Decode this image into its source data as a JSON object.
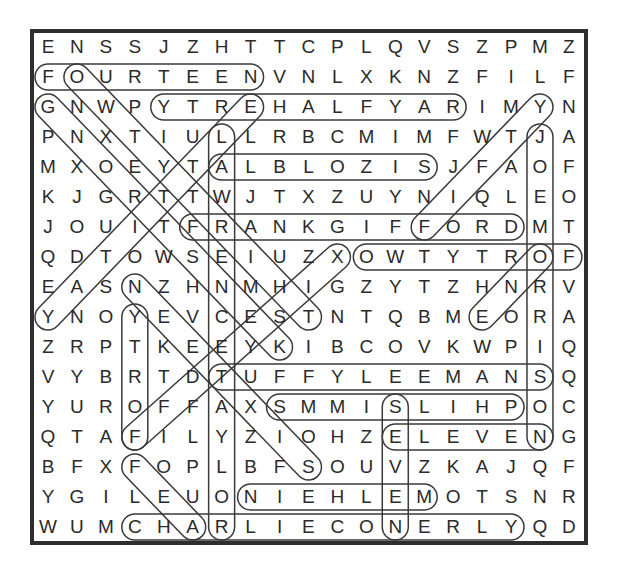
{
  "puzzle": {
    "type": "word-search",
    "rows": 17,
    "cols": 19,
    "grid": [
      "ENSSJZHTTCPLQVSZPMZ",
      "FOURTEENVNLXKNZFILF",
      "GNWPYTREHALFYARIMYN",
      "PNXTIULLRBCMIMFWTJA",
      "MXOEYTALBLOZISJFAOF",
      "KJGRTTWJTXZUYNIQLEO",
      "JOUITFRANKGIFFORDMT",
      "QDTOWSEIUZXOWTYTROF",
      "EASNZHNMHIGZYTZHNRV",
      "YNOYEVCESTNTQBMEORA",
      "ZRPTKEEYKIBCOVKWPIQ",
      "VYBRTDTUFFYLEEMANSQ",
      "YUROFFAXSMMISLIHPOC",
      "QTAFILYZIOHZELEVENG",
      "BFXFOPLBFSOUVZKAJQF",
      "YGILEUONIEHLEMOTSNR",
      "WUMCHARLIECONERLYQD"
    ],
    "found_words": [
      {
        "word": "FOURTEEN",
        "start": [
          1,
          0
        ],
        "end": [
          1,
          7
        ]
      },
      {
        "word": "RAYFLAHERTY",
        "start": [
          2,
          14
        ],
        "end": [
          2,
          4
        ]
      },
      {
        "word": "ALBLOZIS",
        "start": [
          4,
          6
        ],
        "end": [
          4,
          13
        ]
      },
      {
        "word": "FRANKGIFFORD",
        "start": [
          6,
          5
        ],
        "end": [
          6,
          16
        ]
      },
      {
        "word": "FORTYTWO",
        "start": [
          7,
          18
        ],
        "end": [
          7,
          11
        ]
      },
      {
        "word": "TUFFYLEEMANS",
        "start": [
          11,
          6
        ],
        "end": [
          11,
          17
        ]
      },
      {
        "word": "PHILSIMMS",
        "start": [
          12,
          16
        ],
        "end": [
          12,
          8
        ]
      },
      {
        "word": "ELEVEN",
        "start": [
          13,
          12
        ],
        "end": [
          13,
          17
        ]
      },
      {
        "word": "MELHEIN",
        "start": [
          15,
          13
        ],
        "end": [
          15,
          7
        ]
      },
      {
        "word": "CHARLIECONERLY",
        "start": [
          16,
          3
        ],
        "end": [
          16,
          16
        ]
      },
      {
        "word": "LAWRENCETAYLOR",
        "start": [
          3,
          6
        ],
        "end": [
          16,
          6
        ]
      },
      {
        "word": "JOEMORRISON",
        "start": [
          3,
          17
        ],
        "end": [
          13,
          17
        ]
      },
      {
        "word": "FORTY",
        "start": [
          13,
          3
        ],
        "end": [
          9,
          3
        ]
      },
      {
        "word": "SEVEN",
        "start": [
          12,
          12
        ],
        "end": [
          16,
          12
        ]
      },
      {
        "word": "THIRTYTWO",
        "start": [
          9,
          9
        ],
        "end": [
          1,
          1
        ]
      },
      {
        "word": "KENSTRONG",
        "start": [
          10,
          8
        ],
        "end": [
          2,
          0
        ]
      },
      {
        "word": "YATITTLE",
        "start": [
          9,
          0
        ],
        "end": [
          2,
          7
        ]
      },
      {
        "word": "SIXTEEN",
        "start": [
          14,
          9
        ],
        "end": [
          8,
          3
        ]
      },
      {
        "word": "FIFTYSIX",
        "start": [
          13,
          3
        ],
        "end": [
          7,
          10
        ]
      },
      {
        "word": "FOUR",
        "start": [
          14,
          3
        ],
        "end": [
          16,
          5
        ]
      },
      {
        "word": "FIFTY",
        "start": [
          6,
          13
        ],
        "end": [
          2,
          17
        ]
      },
      {
        "word": "ONE",
        "start": [
          7,
          17
        ],
        "end": [
          9,
          15
        ]
      }
    ]
  },
  "colors": {
    "text": "#2b2b2b",
    "frame": "#2e2e2e",
    "loop": "#3a3a3a",
    "background": "#ffffff"
  }
}
